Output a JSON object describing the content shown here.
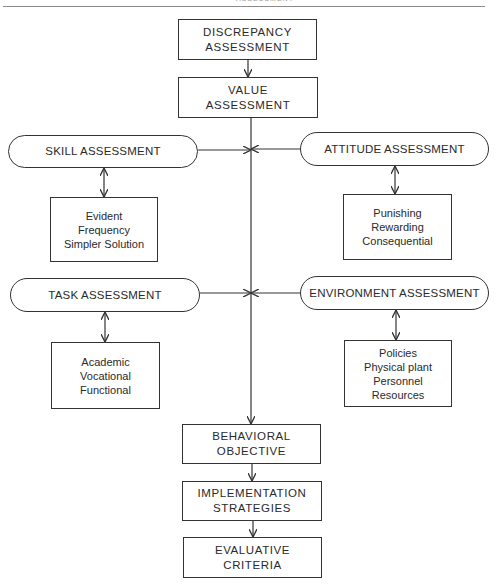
{
  "header": {
    "running_title": "ASSESSMENT"
  },
  "flow_top": [
    {
      "id": "discrepancy",
      "label": "DISCREPANCY\nASSESSMENT"
    },
    {
      "id": "value",
      "label": "VALUE\nASSESSMENT"
    }
  ],
  "assessments": {
    "skill": {
      "label": "SKILL ASSESSMENT",
      "details": "Evident\nFrequency\nSimpler Solution"
    },
    "attitude": {
      "label": "ATTITUDE ASSESSMENT",
      "details": "Punishing\nRewarding\nConsequential"
    },
    "task": {
      "label": "TASK ASSESSMENT",
      "details": "Academic\nVocational\nFunctional"
    },
    "environment": {
      "label": "ENVIRONMENT ASSESSMENT",
      "details": "Policies\nPhysical plant\nPersonnel\nResources"
    }
  },
  "flow_bottom": [
    {
      "id": "behavioral",
      "label": "BEHAVIORAL\nOBJECTIVE"
    },
    {
      "id": "implementation",
      "label": "IMPLEMENTATION\nSTRATEGIES"
    },
    {
      "id": "evaluative",
      "label": "EVALUATIVE\nCRITERIA"
    }
  ],
  "colors": {
    "line": "#333333",
    "background": "#ffffff",
    "text": "#2a2a2a"
  }
}
